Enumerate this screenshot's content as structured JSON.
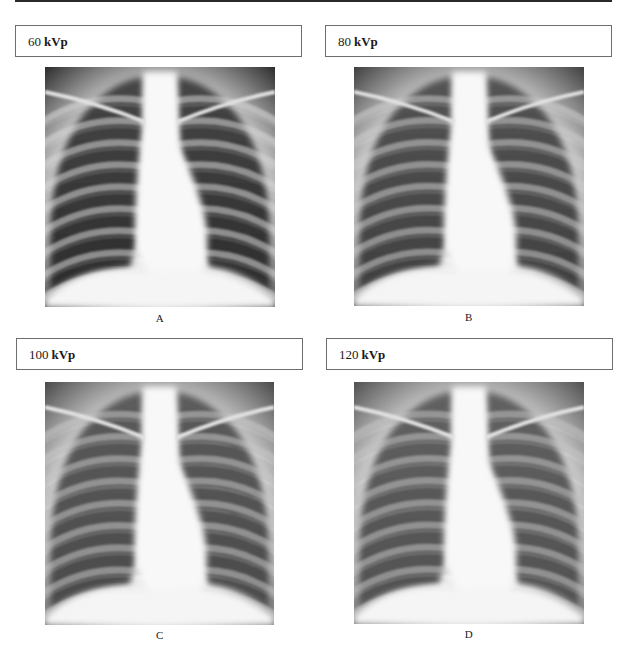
{
  "figure": {
    "panels": [
      {
        "id": "A",
        "kvp_value": "60",
        "kvp_unit": "kVp",
        "caption": "A",
        "contrast": 1.0
      },
      {
        "id": "B",
        "kvp_value": "80",
        "kvp_unit": "kVp",
        "caption": "B",
        "contrast": 0.82
      },
      {
        "id": "C",
        "kvp_value": "100",
        "kvp_unit": "kVp",
        "caption": "C",
        "contrast": 0.72
      },
      {
        "id": "D",
        "kvp_value": "120",
        "kvp_unit": "kVp",
        "caption": "D",
        "contrast": 0.66
      }
    ]
  },
  "colors": {
    "rule": "#2a2a2a",
    "box_border": "#6e6e6e",
    "lung_dark": "#2b2b2b",
    "bone_light": "#f4f4f4"
  }
}
